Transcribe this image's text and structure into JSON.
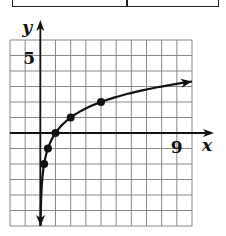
{
  "chart_data": {
    "type": "line",
    "title": "",
    "xlabel": "x",
    "ylabel": "y",
    "xlim": [
      -2,
      10
    ],
    "ylim": [
      -6,
      6
    ],
    "grid": true,
    "tick_labels": {
      "x": [
        {
          "value": 9,
          "label": "9"
        }
      ],
      "y": [
        {
          "value": 5,
          "label": "5"
        }
      ]
    },
    "function": "y = log2(x)",
    "series": [
      {
        "name": "curve",
        "points": [
          [
            0.25,
            -2
          ],
          [
            0.5,
            -1
          ],
          [
            1,
            0
          ],
          [
            2,
            1
          ],
          [
            4,
            2
          ]
        ]
      }
    ],
    "curve_domain": [
      0.0156,
      10
    ],
    "colors": {
      "line": "#111111",
      "grid": "#888888"
    }
  }
}
